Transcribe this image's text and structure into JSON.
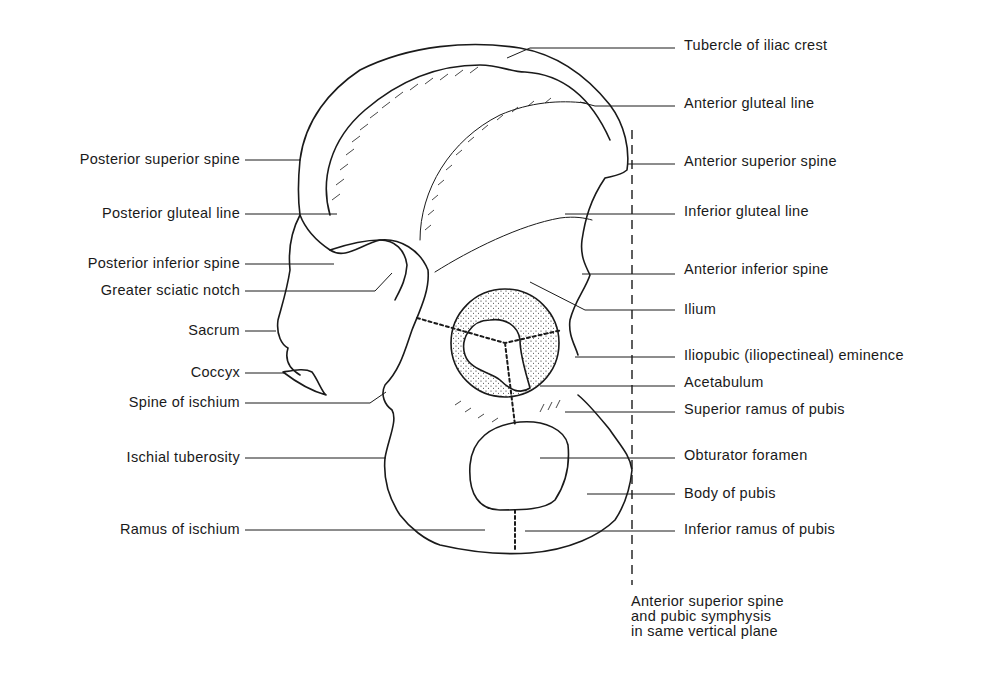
{
  "figure": {
    "colors": {
      "ink": "#1a1a1a",
      "background": "#ffffff"
    },
    "labels_left": [
      {
        "id": "posterior-superior-spine",
        "text": "Posterior superior spine",
        "y": 160
      },
      {
        "id": "posterior-gluteal-line",
        "text": "Posterior gluteal line",
        "y": 214
      },
      {
        "id": "posterior-inferior-spine",
        "text": "Posterior inferior spine",
        "y": 264
      },
      {
        "id": "greater-sciatic-notch",
        "text": "Greater sciatic notch",
        "y": 291
      },
      {
        "id": "sacrum",
        "text": "Sacrum",
        "y": 331
      },
      {
        "id": "coccyx",
        "text": "Coccyx",
        "y": 373
      },
      {
        "id": "spine-of-ischium",
        "text": "Spine of ischium",
        "y": 403
      },
      {
        "id": "ischial-tuberosity",
        "text": "Ischial tuberosity",
        "y": 458
      },
      {
        "id": "ramus-of-ischium",
        "text": "Ramus of ischium",
        "y": 530
      }
    ],
    "labels_right": [
      {
        "id": "tubercle-of-iliac-crest",
        "text": "Tubercle of iliac crest",
        "y": 47
      },
      {
        "id": "anterior-gluteal-line",
        "text": "Anterior gluteal line",
        "y": 104
      },
      {
        "id": "anterior-superior-spine",
        "text": "Anterior superior spine",
        "y": 162
      },
      {
        "id": "inferior-gluteal-line",
        "text": "Inferior gluteal line",
        "y": 212
      },
      {
        "id": "anterior-inferior-spine",
        "text": "Anterior inferior spine",
        "y": 270
      },
      {
        "id": "ilium",
        "text": "Ilium",
        "y": 310
      },
      {
        "id": "iliopubic-eminence",
        "text": "Iliopubic (iliopectineal) eminence",
        "y": 356
      },
      {
        "id": "acetabulum",
        "text": "Acetabulum",
        "y": 383
      },
      {
        "id": "superior-ramus-of-pubis",
        "text": "Superior ramus of pubis",
        "y": 410
      },
      {
        "id": "obturator-foramen",
        "text": "Obturator foramen",
        "y": 456
      },
      {
        "id": "body-of-pubis",
        "text": "Body of pubis",
        "y": 494
      },
      {
        "id": "inferior-ramus-of-pubis",
        "text": "Inferior ramus of pubis",
        "y": 530
      }
    ],
    "note": "Anterior superior spine\nand pubic symphysis\nin same vertical plane"
  }
}
